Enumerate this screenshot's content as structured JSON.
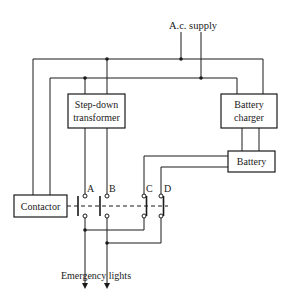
{
  "diagram": {
    "title": "",
    "supply_label": "A.c. supply",
    "blocks": {
      "transformer": [
        "Step-down",
        "transformer"
      ],
      "charger": [
        "Battery",
        "charger"
      ],
      "battery": "Battery",
      "contactor": "Contactor"
    },
    "contacts": [
      "A",
      "B",
      "C",
      "D"
    ],
    "output_label": "Emergency lights",
    "colors": {
      "line": "#1a1a1a",
      "background": "#ffffff"
    }
  }
}
